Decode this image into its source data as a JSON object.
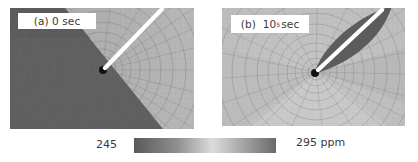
{
  "figure": {
    "panels": [
      {
        "id": "a",
        "label_prefix": "(a)",
        "label_value": "0 sec",
        "description": "Stress-induced concentration field at t = 0; mesh with crack, sharp diagonal boundary between low (dark) and high (light) concentration"
      },
      {
        "id": "b",
        "label_prefix": "(b)",
        "label_base": "10",
        "label_exponent": "5",
        "label_unit": "sec",
        "description": "Concentration field at t = 10^5 sec; dark lens-shaped region around the crack, lighter redistributed field elsewhere"
      }
    ],
    "colorbar": {
      "min_label": "245",
      "max_label": "295 ppm",
      "min_value": 245,
      "max_value": 295,
      "unit": "ppm",
      "colors": [
        "#5a5a5a",
        "#8a8a8a",
        "#d8d8d8",
        "#a0a0a0",
        "#6a6a6a"
      ]
    },
    "colors": {
      "dark_region": "#5f5f5f",
      "mid_region": "#9a9a9a",
      "light_region": "#c4c4c4",
      "crack": "#ffffff",
      "crack_tip": "#111111",
      "mesh_line": "#6e6e6e"
    }
  }
}
